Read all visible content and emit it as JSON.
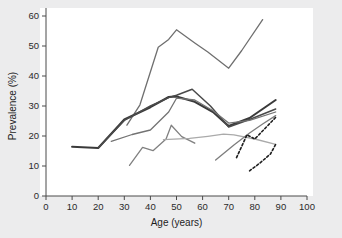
{
  "chart_data": {
    "type": "line",
    "title": "",
    "xlabel": "Age (years)",
    "ylabel": "Prevalence (%)",
    "xlim": [
      0,
      100
    ],
    "ylim": [
      0,
      60
    ],
    "xticks": [
      0,
      10,
      20,
      30,
      40,
      50,
      60,
      70,
      80,
      90,
      100
    ],
    "yticks": [
      0,
      10,
      20,
      30,
      40,
      50,
      60
    ],
    "grid": false,
    "legend": "none",
    "colors": {
      "dark": "#3a3a3a",
      "mid_gray": "#6f6f6f",
      "light_gray": "#a8a8a8",
      "dashed": "#222222"
    },
    "series": [
      {
        "name": "series-1-top-gray",
        "color": "#6f6f6f",
        "style": "solid",
        "width": 1.3,
        "points": [
          [
            31,
            23.6
          ],
          [
            36,
            30.4
          ],
          [
            43,
            49.6
          ],
          [
            47,
            52.2
          ],
          [
            50,
            55.4
          ],
          [
            57,
            51.0
          ],
          [
            62,
            48.0
          ],
          [
            70,
            42.6
          ],
          [
            75,
            48.5
          ],
          [
            83,
            58.8
          ]
        ]
      },
      {
        "name": "series-2-dark-thick",
        "color": "#3a3a3a",
        "style": "solid",
        "width": 2.1,
        "points": [
          [
            10,
            16.4
          ],
          [
            20,
            16.0
          ],
          [
            30,
            25.5
          ],
          [
            40,
            29.6
          ],
          [
            47,
            33.0
          ],
          [
            50,
            33.2
          ],
          [
            57,
            31.4
          ],
          [
            64,
            28.0
          ],
          [
            70,
            23.3
          ],
          [
            78,
            26.0
          ],
          [
            88,
            32.0
          ]
        ]
      },
      {
        "name": "series-3-dark-peak",
        "color": "#4a4a4a",
        "style": "solid",
        "width": 1.5,
        "points": [
          [
            20,
            16.0
          ],
          [
            30,
            25.2
          ],
          [
            40,
            30.0
          ],
          [
            47,
            32.8
          ],
          [
            50,
            33.6
          ],
          [
            56,
            35.6
          ],
          [
            63,
            30.0
          ],
          [
            70,
            23.0
          ],
          [
            78,
            25.5
          ],
          [
            88,
            29.0
          ]
        ]
      },
      {
        "name": "series-4-mid-gray",
        "color": "#737373",
        "style": "solid",
        "width": 1.3,
        "points": [
          [
            25,
            18.2
          ],
          [
            33,
            20.5
          ],
          [
            40,
            22.0
          ],
          [
            47,
            28.0
          ],
          [
            50,
            32.6
          ],
          [
            57,
            32.0
          ],
          [
            64,
            28.4
          ],
          [
            70,
            24.3
          ],
          [
            78,
            25.2
          ],
          [
            88,
            28.0
          ]
        ]
      },
      {
        "name": "series-5-gray-spike",
        "color": "#808080",
        "style": "solid",
        "width": 1.3,
        "points": [
          [
            32,
            10.2
          ],
          [
            37,
            16.2
          ],
          [
            41,
            15.1
          ],
          [
            46,
            19.0
          ],
          [
            48,
            23.6
          ],
          [
            52,
            19.8
          ],
          [
            57,
            17.6
          ]
        ]
      },
      {
        "name": "series-6-light-flat",
        "color": "#aaaaaa",
        "style": "solid",
        "width": 1.3,
        "points": [
          [
            45,
            18.8
          ],
          [
            55,
            19.2
          ],
          [
            62,
            19.9
          ],
          [
            68,
            20.6
          ],
          [
            72,
            20.4
          ],
          [
            80,
            19.0
          ],
          [
            88,
            17.2
          ]
        ]
      },
      {
        "name": "series-7-gray-rising",
        "color": "#7d7d7d",
        "style": "solid",
        "width": 1.3,
        "points": [
          [
            65,
            12.0
          ],
          [
            72,
            17.0
          ],
          [
            78,
            21.0
          ],
          [
            83,
            24.0
          ],
          [
            88,
            26.8
          ]
        ]
      },
      {
        "name": "series-8-dashed-upper",
        "color": "#1f1f1f",
        "style": "dashed",
        "width": 1.6,
        "points": [
          [
            73,
            12.8
          ],
          [
            77,
            20.4
          ],
          [
            80,
            19.0
          ],
          [
            84,
            22.6
          ],
          [
            88,
            26.2
          ]
        ]
      },
      {
        "name": "series-9-dashed-lower",
        "color": "#1f1f1f",
        "style": "dashed",
        "width": 1.6,
        "points": [
          [
            78,
            8.4
          ],
          [
            82,
            11.0
          ],
          [
            86,
            14.0
          ],
          [
            88,
            17.2
          ]
        ]
      }
    ]
  },
  "axes": {
    "x_title": "Age (years)",
    "y_title": "Prevalence (%)",
    "x_tick_labels": [
      "0",
      "10",
      "20",
      "30",
      "40",
      "50",
      "60",
      "70",
      "80",
      "90",
      "100"
    ],
    "y_tick_labels": [
      "0",
      "10",
      "20",
      "30",
      "40",
      "50",
      "60"
    ]
  }
}
